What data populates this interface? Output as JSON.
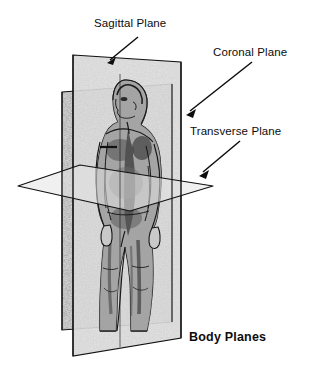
{
  "diagram": {
    "title": "Body Planes",
    "labels": {
      "sagittal": "Sagittal Plane",
      "coronal": "Coronal Plane",
      "transverse": "Transverse Plane"
    },
    "colors": {
      "ink": "#101010",
      "plane_fill": "#d9d9d9",
      "plane_fill_light": "#e6e6e6",
      "background": "#ffffff",
      "body_shade": "#8c8c8c"
    },
    "planes": [
      {
        "name": "sagittal-plane",
        "orientation": "vertical-front-to-back",
        "label_key": "sagittal"
      },
      {
        "name": "coronal-plane",
        "orientation": "vertical-side-to-side",
        "label_key": "coronal"
      },
      {
        "name": "transverse-plane",
        "orientation": "horizontal",
        "label_key": "transverse"
      }
    ],
    "leader_lines": [
      {
        "name": "sagittal-arrow",
        "from": [
          138,
          37
        ],
        "to": [
          107,
          63
        ]
      },
      {
        "name": "coronal-arrow",
        "from": [
          252,
          62
        ],
        "to": [
          186,
          115
        ]
      },
      {
        "name": "transverse-arrow",
        "from": [
          240,
          141
        ],
        "to": [
          199,
          176
        ]
      }
    ]
  }
}
